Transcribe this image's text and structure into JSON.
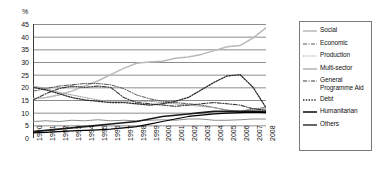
{
  "chart_data": {
    "type": "line",
    "title": "",
    "xlabel": "",
    "ylabel": "%",
    "ylim": [
      0,
      45
    ],
    "ytick_labels": [
      "45",
      "40",
      "35",
      "30",
      "25",
      "20",
      "15",
      "10",
      "5",
      "0"
    ],
    "yticks": [
      45,
      40,
      35,
      30,
      25,
      20,
      15,
      10,
      5,
      0
    ],
    "grid": true,
    "legend_position": "right",
    "categories": [
      "1990",
      "1991",
      "1992",
      "1993",
      "1994",
      "1995",
      "1996",
      "1997",
      "1998",
      "1999",
      "2000",
      "2001",
      "2002",
      "2003",
      "2004",
      "2005",
      "2006",
      "2007",
      "2008"
    ],
    "series": [
      {
        "name": "Social",
        "style": "solid-light",
        "color": "#b9b9b9",
        "values": [
          15.5,
          16.0,
          17.0,
          18.5,
          20.5,
          22.5,
          25.0,
          27.5,
          29.5,
          30.0,
          30.3,
          31.5,
          32.0,
          33.0,
          34.5,
          36.0,
          36.5,
          39.5,
          43.5
        ]
      },
      {
        "name": "Economic",
        "style": "dash-dot",
        "color": "#5a5a5a",
        "values": [
          18.5,
          19.5,
          20.5,
          21.0,
          21.5,
          21.5,
          21.0,
          19.5,
          17.0,
          15.5,
          14.5,
          14.0,
          13.5,
          13.0,
          12.0,
          11.0,
          10.5,
          11.5,
          12.0
        ]
      },
      {
        "name": "Production",
        "style": "dotted-light",
        "color": "#9a9a9a",
        "values": [
          20.5,
          19.5,
          18.0,
          17.0,
          16.0,
          15.0,
          14.5,
          14.5,
          14.5,
          14.5,
          14.0,
          13.5,
          13.0,
          12.5,
          12.0,
          11.0,
          10.5,
          11.0,
          11.5
        ]
      },
      {
        "name": "Multi-sector",
        "style": "solid-mid",
        "color": "#8c8c8c",
        "values": [
          6.5,
          6.8,
          6.5,
          7.0,
          6.8,
          7.2,
          6.8,
          7.0,
          6.8,
          7.0,
          7.2,
          7.0,
          7.5,
          7.5,
          7.0,
          7.0,
          7.2,
          7.5,
          7.5
        ]
      },
      {
        "name": "General Programme Aid",
        "style": "dash-dot-dark",
        "color": "#3a3a3a",
        "values": [
          15.0,
          17.5,
          19.5,
          20.5,
          20.0,
          20.5,
          20.0,
          16.0,
          14.0,
          13.5,
          13.0,
          12.5,
          13.0,
          13.5,
          14.0,
          13.5,
          13.0,
          11.5,
          11.0
        ]
      },
      {
        "name": "Debt",
        "style": "dotted-dark",
        "color": "#2a2a2a",
        "values": [
          20.0,
          19.0,
          17.5,
          16.0,
          15.0,
          14.5,
          14.0,
          14.0,
          13.5,
          13.0,
          13.5,
          14.5,
          16.0,
          19.0,
          22.0,
          24.5,
          25.0,
          20.0,
          12.0
        ]
      },
      {
        "name": "Humanitarian",
        "style": "solid-dark",
        "color": "#1a1a1a",
        "values": [
          2.5,
          3.0,
          3.5,
          4.0,
          4.5,
          5.0,
          5.5,
          6.0,
          6.5,
          7.5,
          8.5,
          9.0,
          9.5,
          10.0,
          10.5,
          10.5,
          10.5,
          10.5,
          10.5
        ]
      },
      {
        "name": "Others",
        "style": "solid-black",
        "color": "#000000",
        "values": [
          2.0,
          2.2,
          2.5,
          2.8,
          3.0,
          3.2,
          3.5,
          4.0,
          4.5,
          5.5,
          6.5,
          7.5,
          8.5,
          9.0,
          9.5,
          9.8,
          10.0,
          10.2,
          10.0
        ]
      }
    ]
  },
  "legend": {
    "items": [
      {
        "label": "Social"
      },
      {
        "label": "Economic"
      },
      {
        "label": "Production"
      },
      {
        "label": "Multi-sector"
      },
      {
        "label": "General Programme Aid"
      },
      {
        "label": "Debt"
      },
      {
        "label": "Humanitarian"
      },
      {
        "label": "Others"
      }
    ]
  }
}
